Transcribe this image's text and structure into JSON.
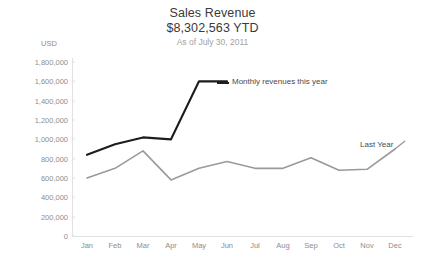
{
  "header": {
    "title": "Sales Revenue",
    "subtitle": "$8,302,563 YTD",
    "note": "As of July 30, 2011"
  },
  "axis": {
    "unit_label": "USD"
  },
  "annotations": {
    "current_series": "Monthly revenues this year",
    "last_series": "Last Year"
  },
  "chart_data": {
    "type": "line",
    "title": "Sales Revenue",
    "subtitle": "$8,302,563 YTD",
    "note": "As of July 30, 2011",
    "xlabel": "",
    "ylabel": "USD",
    "ylim": [
      0,
      1800000
    ],
    "ytick_step": 200000,
    "ytick_labels": [
      "1,800,000",
      "1,600,000",
      "1,400,000",
      "1,200,000",
      "1,000,000",
      "800,000",
      "600,000",
      "400,000",
      "200,000",
      "0"
    ],
    "ytick_values": [
      1800000,
      1600000,
      1400000,
      1200000,
      1000000,
      800000,
      600000,
      400000,
      200000,
      0
    ],
    "grid": false,
    "legend": "inline-annotations",
    "categories": [
      "Jan",
      "Feb",
      "Mar",
      "Apr",
      "May",
      "Jun",
      "Jul",
      "Aug",
      "Sep",
      "Oct",
      "Nov",
      "Dec"
    ],
    "series": [
      {
        "name": "Monthly revenues this year",
        "color": "#1d1d1d",
        "values": [
          840000,
          950000,
          1020000,
          1000000,
          1600000,
          1600000,
          null,
          null,
          null,
          null,
          null,
          null
        ]
      },
      {
        "name": "Last Year",
        "color": "#9a9a9a",
        "values": [
          600000,
          700000,
          880000,
          580000,
          700000,
          770000,
          700000,
          700000,
          810000,
          680000,
          690000,
          900000
        ]
      }
    ]
  }
}
